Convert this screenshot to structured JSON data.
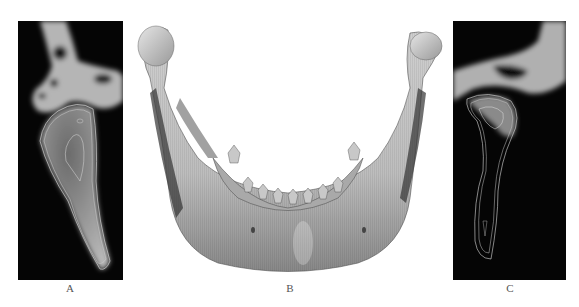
{
  "figure": {
    "panels": [
      {
        "id": "A",
        "label": "A",
        "description": "Sagittal CT slice of mandibular condyle with contour outlines"
      },
      {
        "id": "B",
        "label": "B",
        "description": "3D reconstruction of mandible, frontal view"
      },
      {
        "id": "C",
        "label": "C",
        "description": "Sagittal CT slice of mandibular condyle with contour outlines"
      }
    ]
  }
}
